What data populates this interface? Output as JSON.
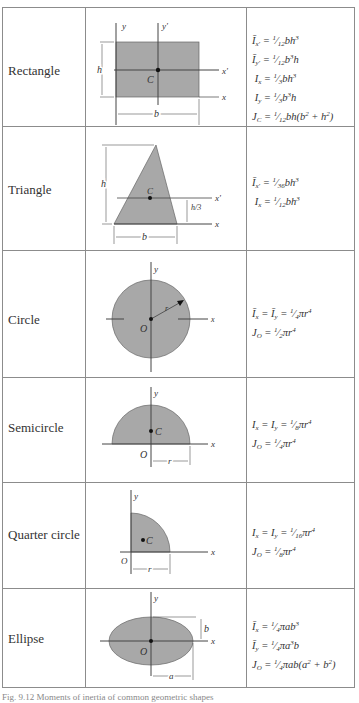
{
  "table": {
    "rows": [
      {
        "name": "Rectangle",
        "figure_labels": {
          "y": "y",
          "y_prime": "y'",
          "x": "x",
          "x_prime": "x'",
          "centroid": "C",
          "height": "h",
          "base": "b"
        },
        "formulas": [
          "Ī_x' = (1/12) b h³",
          "Ī_y' = (1/12) b³ h",
          "I_x = (1/3) b h³",
          "I_y = (1/3) b³ h",
          "J_C = (1/12) b h (b² + h²)"
        ]
      },
      {
        "name": "Triangle",
        "figure_labels": {
          "x": "x",
          "x_prime": "x'",
          "centroid": "C",
          "height": "h",
          "third_height": "h/3",
          "base": "b"
        },
        "formulas": [
          "Ī_x' = (1/36) b h³",
          "I_x = (1/12) b h³"
        ]
      },
      {
        "name": "Circle",
        "figure_labels": {
          "y": "y",
          "x": "x",
          "origin": "O",
          "radius": "r"
        },
        "formulas": [
          "Ī_x = Ī_y = (1/4) π r⁴",
          "J_O = (1/2) π r⁴"
        ]
      },
      {
        "name": "Semicircle",
        "figure_labels": {
          "y": "y",
          "x": "x",
          "origin": "O",
          "centroid": "C",
          "radius": "r"
        },
        "formulas": [
          "I_x = I_y = (1/8) π r⁴",
          "J_O = (1/4) π r⁴"
        ]
      },
      {
        "name": "Quarter circle",
        "figure_labels": {
          "y": "y",
          "x": "x",
          "origin": "O",
          "centroid": "C",
          "radius": "r"
        },
        "formulas": [
          "I_x = I_y = (1/16) π r⁴",
          "J_O = (1/8) π r⁴"
        ]
      },
      {
        "name": "Ellipse",
        "figure_labels": {
          "y": "y",
          "x": "x",
          "origin": "O",
          "semi_major": "a",
          "semi_minor": "b"
        },
        "formulas": [
          "Ī_x = (1/4) π a b³",
          "Ī_y = (1/4) π a³ b",
          "J_O = (1/4) π a b (a² + b²)"
        ]
      }
    ]
  },
  "caption": "Fig. 9.12  Moments of inertia of common geometric shapes",
  "colors": {
    "shape_fill": "#a8a8a8",
    "line": "#555555",
    "border": "#8c8c8c"
  }
}
